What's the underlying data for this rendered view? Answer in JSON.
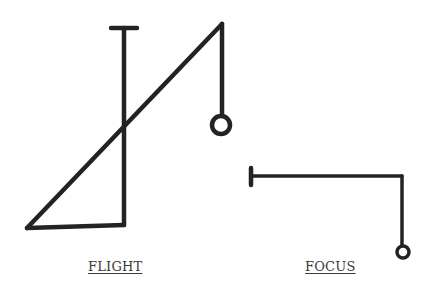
{
  "diagrams": [
    {
      "id": "flight",
      "label": "FLIGHT"
    },
    {
      "id": "focus",
      "label": "FOCUS"
    }
  ],
  "colors": {
    "stroke": "#232323",
    "label": "#3a3a3a",
    "background": "#ffffff"
  }
}
